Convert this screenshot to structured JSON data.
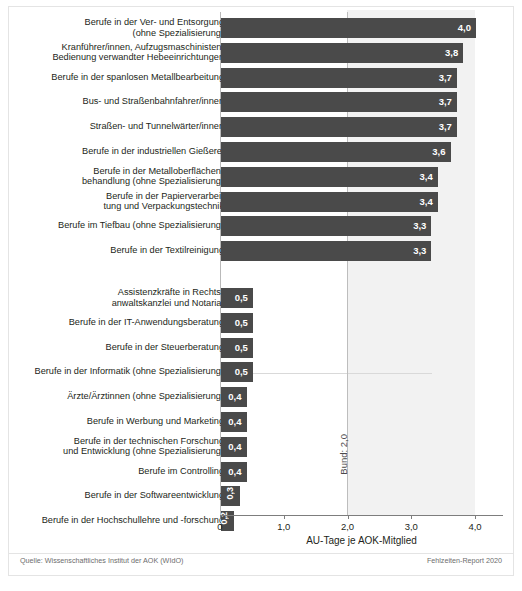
{
  "chart_data": {
    "type": "bar",
    "orientation": "horizontal",
    "title": "",
    "xlabel": "AU-Tage je AOK-Mitglied",
    "ylabel": "",
    "xlim": [
      0,
      4.4
    ],
    "xticks": [
      "0",
      "1,0",
      "2,0",
      "3,0",
      "4,0"
    ],
    "xtick_values": [
      0,
      1.0,
      2.0,
      3.0,
      4.0
    ],
    "grid": false,
    "legend": "none",
    "reference_line": {
      "label": "Bund: 2,0",
      "value": 2.0
    },
    "groups": [
      {
        "name": "top",
        "categories": [
          "Berufe in der Ver- und Entsorgung\n(ohne Spezialisierung)",
          "Kranführer/innen, Aufzugsmaschinisten,\nBedienung verwandter Hebeeinrichtungen",
          "Berufe in der spanlosen Metallbearbeitung",
          "Bus- und Straßenbahnfahrer/innen",
          "Straßen- und Tunnelwärter/innen",
          "Berufe in der industriellen Gießerei",
          "Berufe in der Metalloberflächen-\nbehandlung (ohne Spezialisierung)",
          "Berufe in der Papierverarbei-\ntung und Verpackungstechnik",
          "Berufe im Tiefbau (ohne Spezialisierung)",
          "Berufe in der Textilreinigung"
        ],
        "values": [
          4.0,
          3.8,
          3.7,
          3.7,
          3.7,
          3.6,
          3.4,
          3.4,
          3.3,
          3.3
        ],
        "labels": [
          "4,0",
          "3,8",
          "3,7",
          "3,7",
          "3,7",
          "3,6",
          "3,4",
          "3,4",
          "3,3",
          "3,3"
        ]
      },
      {
        "name": "bottom",
        "categories": [
          "Assistenzkräfte in Rechts-\nanwaltskanzlei und Notariat",
          "Berufe in der IT-Anwendungsberatung",
          "Berufe in der Steuerberatung",
          "Berufe in der Informatik (ohne Spezialisierung)",
          "Ärzte/Ärztinnen (ohne Spezialisierung)",
          "Berufe in Werbung und Marketing",
          "Berufe in der technischen Forschung\nund Entwicklung (ohne Spezialisierung)",
          "Berufe im Controlling",
          "Berufe in der Softwareentwicklung",
          "Berufe in der Hochschullehre und -forschung"
        ],
        "values": [
          0.5,
          0.5,
          0.5,
          0.5,
          0.4,
          0.4,
          0.4,
          0.4,
          0.3,
          0.2
        ],
        "labels": [
          "0,5",
          "0,5",
          "0,5",
          "0,5",
          "0,4",
          "0,4",
          "0,4",
          "0,4",
          "0,3",
          "0,2"
        ]
      }
    ]
  },
  "footer": {
    "source": "Quelle: Wissenschaftliches Institut der AOK (WIdO)",
    "report": "Fehlzeiten-Report 2020"
  },
  "colors": {
    "bar": "#4a4a4a",
    "band": "#f2f2f2",
    "axis": "#7d7d7d",
    "text": "#231f20"
  }
}
